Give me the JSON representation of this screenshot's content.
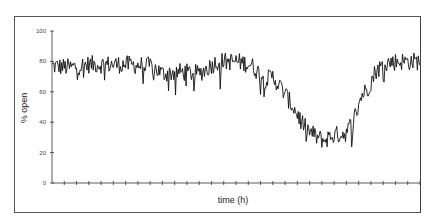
{
  "chart_data": {
    "type": "line",
    "title": "",
    "xlabel": "time (h)",
    "ylabel": "% open",
    "ylim": [
      0,
      100
    ],
    "yticks": [
      0,
      20,
      40,
      60,
      80,
      100
    ],
    "xtick_count": 30,
    "xtick_labels": [],
    "grid": false,
    "legend": null,
    "series": [
      {
        "name": "% open",
        "color": "#111111",
        "envelope": {
          "x_fraction": [
            0.0,
            0.05,
            0.1,
            0.2,
            0.27,
            0.3,
            0.35,
            0.4,
            0.45,
            0.5,
            0.54,
            0.58,
            0.6,
            0.63,
            0.66,
            0.69,
            0.72,
            0.74,
            0.76,
            0.8,
            0.82,
            0.84,
            0.86,
            0.88,
            0.91,
            0.94,
            1.0
          ],
          "values": [
            77,
            76,
            78,
            78,
            77,
            72,
            73,
            72,
            80,
            80,
            78,
            68,
            70,
            60,
            48,
            36,
            30,
            28,
            31,
            33,
            42,
            57,
            63,
            74,
            79,
            80,
            80
          ]
        },
        "noise_amplitude": 6,
        "points": 420
      }
    ]
  }
}
